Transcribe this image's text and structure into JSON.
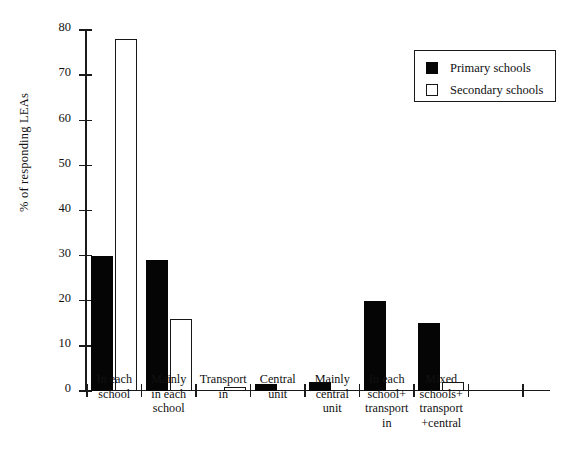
{
  "chart_data": {
    "type": "bar",
    "title": "",
    "xlabel": "",
    "ylabel": "% of responding LEAs",
    "ylim": [
      0,
      80
    ],
    "yticks": [
      0,
      10,
      20,
      30,
      40,
      50,
      60,
      70,
      80
    ],
    "grid": false,
    "legend_position": "top-right",
    "categories": [
      "In each\nschool",
      "Mainly\nin each\nschool",
      "Transport\nin",
      "Central\nunit",
      "Mainly\ncentral\nunit",
      "In each\nschool+\ntransport\nin",
      "Mixed\nschools+\ntransport\n+central"
    ],
    "series": [
      {
        "name": "Primary schools",
        "color": "#050505",
        "style": "filled",
        "values": [
          30,
          29,
          0,
          1.5,
          2,
          20,
          15
        ]
      },
      {
        "name": "Secondary schools",
        "color": "#ffffff",
        "style": "open",
        "values": [
          78,
          16,
          1,
          0,
          0,
          0,
          2
        ]
      }
    ]
  },
  "legend": {
    "items": [
      {
        "label": "Primary schools",
        "swatch": "filled-square-icon"
      },
      {
        "label": "Secondary schools",
        "swatch": "open-square-icon"
      }
    ]
  }
}
